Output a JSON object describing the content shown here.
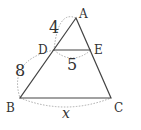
{
  "diagram": {
    "type": "geometry-triangle",
    "points": {
      "A": {
        "label": "A",
        "x": 76,
        "y": 18
      },
      "B": {
        "label": "B",
        "x": 20,
        "y": 98
      },
      "C": {
        "label": "C",
        "x": 111,
        "y": 98
      },
      "D": {
        "label": "D",
        "x": 54,
        "y": 50
      },
      "E": {
        "label": "E",
        "x": 91,
        "y": 50
      }
    },
    "measurements": {
      "AD": "4",
      "DB": "8",
      "DE": "5",
      "BC": "x"
    },
    "colors": {
      "line": "#444444",
      "dotted": "#aaaaaa",
      "text": "#333333"
    }
  }
}
